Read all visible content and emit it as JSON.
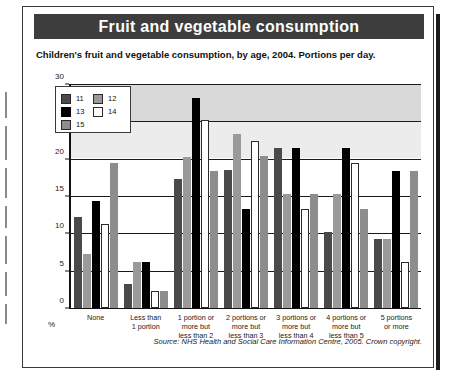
{
  "figure": {
    "title": "Fruit and vegetable consumption",
    "subtitle": "Children's fruit and vegetable consumption, by age, 2004. Portions per day.",
    "source": "Source: NHS Health and Social Care Information Centre, 2005. Crown copyright.",
    "y_unit_label": "%"
  },
  "colors": {
    "title_bar": "#3d3d3d",
    "age_11": "#4a4a4a",
    "age_12": "#9a9a9a",
    "age_13": "#000000",
    "age_14": "#ffffff",
    "age_15": "#8d8d8d",
    "plot_background": "#d9d9d9",
    "gridline": "#1a1a1a"
  },
  "chart_data": {
    "type": "bar",
    "title": "Fruit and vegetable consumption",
    "subtitle": "Children's fruit and vegetable consumption, by age, 2004. Portions per day.",
    "xlabel": "",
    "ylabel": "%",
    "ylim": [
      0,
      30
    ],
    "yticks": [
      0,
      5,
      10,
      15,
      20,
      25,
      30
    ],
    "grid": true,
    "legend_position": "top-left",
    "categories": [
      "None",
      "Less than 1 portion",
      "1 portion or more but less than 2",
      "2 portions or more but less than 3",
      "3 portions or more but less than 4",
      "4 portions or more but less than 5",
      "5 portions or more"
    ],
    "category_lines": [
      [
        "None"
      ],
      [
        "Less than",
        "1 portion"
      ],
      [
        "1 portion or",
        "more but",
        "less than 2"
      ],
      [
        "2 portions or",
        "more but",
        "less than 3"
      ],
      [
        "3 portions or",
        "more but",
        "less than 4"
      ],
      [
        "4 portions or",
        "more but",
        "less than 5"
      ],
      [
        "5 portions",
        "or more"
      ]
    ],
    "series": [
      {
        "name": "11",
        "values": [
          12.2,
          3.2,
          17.3,
          18.5,
          21.5,
          10.2,
          9.3
        ]
      },
      {
        "name": "12",
        "values": [
          7.2,
          6.1,
          20.3,
          23.4,
          15.3,
          15.3,
          9.3
        ]
      },
      {
        "name": "13",
        "values": [
          14.3,
          6.1,
          28.3,
          13.3,
          21.5,
          21.5,
          18.4
        ]
      },
      {
        "name": "14",
        "values": [
          11.2,
          2.2,
          25.3,
          22.4,
          13.3,
          19.5,
          6.1
        ]
      },
      {
        "name": "15",
        "values": [
          19.5,
          2.2,
          18.4,
          20.4,
          15.3,
          13.3,
          18.4
        ]
      }
    ]
  },
  "legend": {
    "entries": [
      {
        "label": "11",
        "key": "b11"
      },
      {
        "label": "12",
        "key": "b12"
      },
      {
        "label": "13",
        "key": "b13"
      },
      {
        "label": "14",
        "key": "b14"
      },
      {
        "label": "15",
        "key": "b15"
      }
    ]
  }
}
